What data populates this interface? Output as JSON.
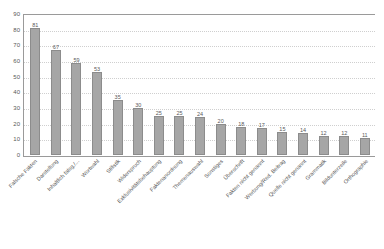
{
  "chart_data": {
    "type": "bar",
    "title": "",
    "subtitle": "",
    "xlabel": "",
    "ylabel": "",
    "ylim": [
      0,
      90
    ],
    "ytick_step": 10,
    "yticks": [
      90,
      80,
      70,
      60,
      50,
      40,
      30,
      20,
      10,
      0
    ],
    "grid": "horizontal-dotted",
    "legend": "none",
    "orientation": "vertical",
    "bar_color": "#a6a6a6",
    "bar_border_color": "#8c8c8c",
    "axis_color": "#9a9a9a",
    "gridline_color": "#cfcfcf",
    "text_color": "#595959",
    "value_labels_shown": true,
    "category_label_rotation": -45,
    "categories": [
      "Falsche Fakten",
      "Darstellung",
      "Inhaltlich falsg./...",
      "Wortwahl",
      "Stilistik",
      "Widerspruch",
      "Exklusivitätsbehauptung",
      "Faktenanordnung",
      "Themenauswahl",
      "Sonstiges",
      "Überschrift",
      "Fakten nicht genannt",
      "Werbung/Red. Beitrag",
      "Quelle nicht genannt",
      "Grammatik",
      "Bildunterzeile",
      "Orthographie"
    ],
    "values": [
      81,
      67,
      59,
      53,
      35,
      30,
      25,
      25,
      24,
      20,
      18,
      17,
      15,
      14,
      12,
      12,
      11
    ]
  }
}
